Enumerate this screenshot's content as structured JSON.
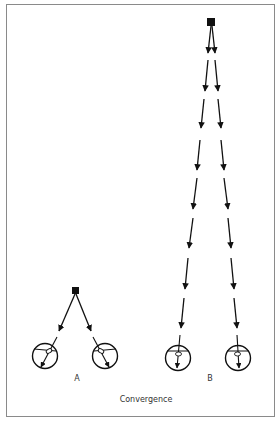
{
  "figure": {
    "caption": "Convergence",
    "panels": [
      {
        "label": "A",
        "description": "Near object: eyes converge strongly"
      },
      {
        "label": "B",
        "description": "Far object: eyes nearly parallel"
      }
    ]
  },
  "colors": {
    "ink": "#111111",
    "frame": "#8a8a8a",
    "background": "#ffffff"
  }
}
